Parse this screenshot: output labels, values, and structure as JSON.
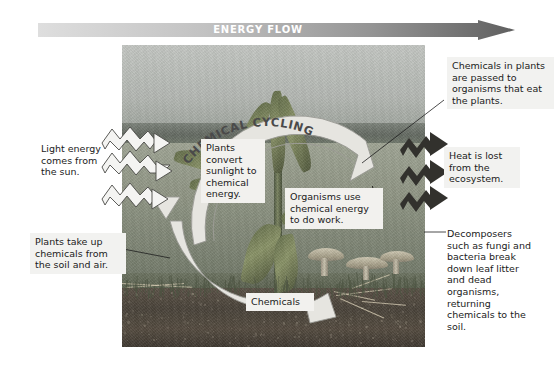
{
  "banner": {
    "label": "ENERGY FLOW",
    "gradient_start": "#dcdcdc",
    "gradient_end": "#6e6e6e"
  },
  "diagram": {
    "cycle_label": "CHEMICAL CYCLING",
    "ring_color": "#e3e2dd",
    "ring_outline": "#9a9a94"
  },
  "callouts": {
    "light_energy": "Light energy comes from the sun.",
    "soil_and_air": "Plants take up chemicals from the soil and air.",
    "eat_plants": "Chemicals in plants are passed to organisms that eat the plants.",
    "heat_lost": "Heat is lost from the ecosystem.",
    "decomposers": "Decomposers such as fungi and bacteria break down leaf litter and dead organisms, returning chemicals to the soil.",
    "plants_convert": "Plants convert sunlight to chemical energy.",
    "organisms_use": "Organisms use chemical energy to do work.",
    "chemicals": "Chemicals"
  },
  "arrows": {
    "light_energy_style": "hollow-zigzag-right",
    "light_energy_count": 3,
    "heat_style": "solid-zigzag-right",
    "heat_count": 3,
    "heat_color": "#3b3b38"
  },
  "photo": {
    "sky_color": "#b8bcb8",
    "treeline_color": "#646a62",
    "field_color": "#8d9382",
    "soil_color": "#4a433a"
  }
}
